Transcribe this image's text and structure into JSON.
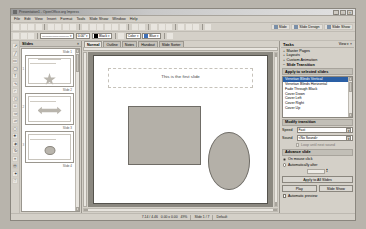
{
  "window": {
    "title": "Presentation1 - OpenOffice.org Impress",
    "minimize": "_",
    "maximize": "□",
    "close": "×"
  },
  "menubar": {
    "items": [
      "File",
      "Edit",
      "View",
      "Insert",
      "Format",
      "Tools",
      "Slide Show",
      "Window",
      "Help"
    ]
  },
  "toolbar_main": {
    "buttons": [
      "new-icon",
      "open-icon",
      "save-icon",
      "email-icon",
      "edit-file-icon",
      "export-pdf-icon",
      "print-icon",
      "print-preview-icon",
      "spelling-icon",
      "autospell-icon",
      "cut-icon",
      "copy-icon",
      "paste-icon",
      "clone-format-icon",
      "undo-icon",
      "redo-icon",
      "chart-icon",
      "table-icon",
      "image-icon",
      "hyperlink-icon",
      "display-grid-icon",
      "helplines-icon",
      "zoom-icon",
      "help-icon"
    ],
    "slide_label": "Slide",
    "slide_design_label": "Slide Design",
    "slide_show_label": "Slide Show"
  },
  "toolbar_line_fill": {
    "line_style": "————————",
    "line_width": "0.00\"",
    "line_color": "Black",
    "fill_style": "Color",
    "fill_color": "Blue",
    "line_color_hex": "#000000",
    "fill_color_hex": "#3f6fb5"
  },
  "drawing_toolbar": {
    "tools": [
      "select-icon",
      "line-icon",
      "rectangle-icon",
      "ellipse-icon",
      "text-icon",
      "curve-icon",
      "connector-icon",
      "basic-shapes-icon",
      "symbol-shapes-icon",
      "block-arrows-icon",
      "flowchart-icon",
      "callout-icon",
      "stars-icon",
      "3d-objects-icon",
      "rotate-icon",
      "align-icon",
      "arrange-icon",
      "effects-icon",
      "interaction-icon"
    ]
  },
  "slides_panel": {
    "title": "Slides",
    "close": "×",
    "thumbnails": [
      {
        "number": "1",
        "label": "Slide 1",
        "shape": "star",
        "has_title": true,
        "has_text": true
      },
      {
        "number": "2",
        "label": "Slide 2",
        "shape": "arrow",
        "has_title": false,
        "has_text": true
      },
      {
        "number": "3",
        "label": "Slide 3",
        "shape": "smiley",
        "has_title": false,
        "has_text": true
      }
    ],
    "bottom_label": "Slide 4"
  },
  "editor": {
    "tabs": [
      {
        "label": "Normal",
        "active": true
      },
      {
        "label": "Outline",
        "active": false
      },
      {
        "label": "Notes",
        "active": false
      },
      {
        "label": "Handout",
        "active": false
      },
      {
        "label": "Slide Sorter",
        "active": false
      }
    ],
    "slide_title_text": "This is the first slide",
    "shapes": [
      {
        "name": "rectangle-shape",
        "fill": "#b4b0a8"
      },
      {
        "name": "ellipse-shape",
        "fill": "#b4b0a8"
      }
    ]
  },
  "tasks_pane": {
    "title": "Tasks",
    "view_label": "View",
    "view_arrow": "▾",
    "close": "×",
    "accordion": [
      {
        "label": "Master Pages",
        "expanded": false
      },
      {
        "label": "Layouts",
        "expanded": false
      },
      {
        "label": "Custom Animation",
        "expanded": false
      },
      {
        "label": "Slide Transition",
        "expanded": true
      }
    ],
    "apply_section_title": "Apply to selected slides",
    "transitions": [
      {
        "label": "Venetian Blinds Vertical",
        "selected": true
      },
      {
        "label": "Venetian Blinds Horizontal",
        "selected": false
      },
      {
        "label": "Fade Through Black",
        "selected": false
      },
      {
        "label": "Cover Down",
        "selected": false
      },
      {
        "label": "Cover Left",
        "selected": false
      },
      {
        "label": "Cover Right",
        "selected": false
      },
      {
        "label": "Cover Up",
        "selected": false
      }
    ],
    "modify_section_title": "Modify transition",
    "speed_label": "Speed",
    "speed_value": "Fast",
    "sound_label": "Sound",
    "sound_value": "<No Sound>",
    "loop_label": "Loop until next sound",
    "advance_section_title": "Advance slide",
    "advance_on_click": "On mouse click",
    "advance_automatic": "Automatically after",
    "advance_time": "",
    "spin_up": "▲",
    "spin_down": "▼",
    "apply_all_label": "Apply to All Slides",
    "play_label": "Play",
    "slideshow_label": "Slide Show",
    "auto_preview_label": "Automatic preview",
    "dropdown_arrow": "▾",
    "selection_color": "#2a5fa5"
  },
  "statusbar": {
    "position": "7.14 / 4.46",
    "size": "0.00 x 0.00",
    "zoom": "49%",
    "slide_index": "Slide 1 / 7",
    "master": "Default"
  }
}
